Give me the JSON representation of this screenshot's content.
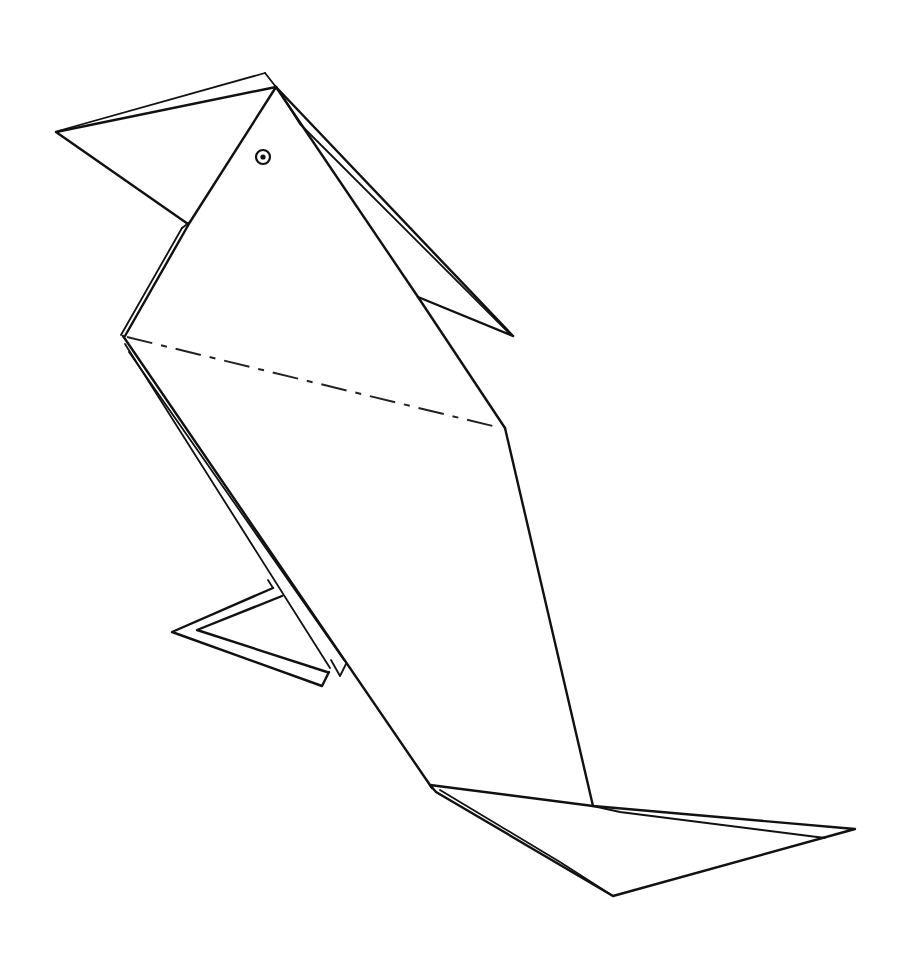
{
  "figure": {
    "stroke_color": "#111111",
    "background_color": "#ffffff",
    "parts": [
      "beak",
      "head",
      "eye",
      "wing",
      "body",
      "fold-line",
      "leg",
      "tail"
    ]
  }
}
